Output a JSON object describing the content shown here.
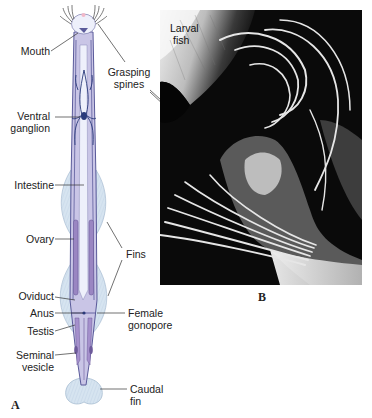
{
  "figure": {
    "panel_a_letter": "A",
    "panel_b_letter": "B",
    "panel_a": {
      "labels": {
        "mouth": "Mouth",
        "ventral_ganglion_1": "Ventral",
        "ventral_ganglion_2": "ganglion",
        "intestine": "Intestine",
        "ovary": "Ovary",
        "oviduct": "Oviduct",
        "anus": "Anus",
        "testis": "Testis",
        "seminal_vesicle_1": "Seminal",
        "seminal_vesicle_2": "vesicle",
        "fins": "Fins",
        "female_gonopore_1": "Female",
        "female_gonopore_2": "gonopore",
        "caudal_fin_1": "Caudal",
        "caudal_fin_2": "fin",
        "grasping_spines_1": "Grasping",
        "grasping_spines_2": "spines"
      }
    },
    "panel_b": {
      "labels": {
        "larval_fish_1": "Larval",
        "larval_fish_2": "fish"
      }
    },
    "colors": {
      "body_fill": "#c9c5e6",
      "body_outline": "#5a5a9a",
      "fin_fill": "#d6e4f0",
      "organ_fill": "#9a86c2",
      "nerve": "#2a3a7a",
      "leader": "#333333"
    }
  }
}
